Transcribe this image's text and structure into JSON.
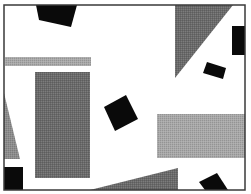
{
  "canvas": {
    "width": 251,
    "height": 194,
    "background": "#ffffff"
  },
  "colors": {
    "black": "#0a0a0a",
    "dark_gray": "#6a6a6a",
    "mid_gray": "#8c8c8c",
    "light_gray": "#a8a8a8",
    "frame": "#3a3a3a"
  },
  "frame": {
    "x": 4,
    "y": 5,
    "w": 241,
    "h": 185
  },
  "shapes": [
    {
      "name": "top-black-quad",
      "type": "polygon",
      "fill": "black",
      "points": "36,5 77,5 71,27 39,20"
    },
    {
      "name": "top-right-gray-triangle",
      "type": "polygon",
      "fill": "dark_gray",
      "points": "175,5 233,5 175,78"
    },
    {
      "name": "right-edge-black-rect",
      "type": "polygon",
      "fill": "black",
      "points": "232,26 245,26 245,55 232,55"
    },
    {
      "name": "small-black-tilted-rect",
      "type": "polygon",
      "fill": "black",
      "points": "207,62 226,68 223,79 203,73"
    },
    {
      "name": "light-gray-stripe",
      "type": "polygon",
      "fill": "light_gray",
      "points": "5,57 91,57 91,66 5,66"
    },
    {
      "name": "dark-gray-rect",
      "type": "polygon",
      "fill": "dark_gray",
      "points": "35,72 90,72 90,178 35,178"
    },
    {
      "name": "left-gray-triangle",
      "type": "polygon",
      "fill": "mid_gray",
      "points": "4,93 4,159 20,159"
    },
    {
      "name": "center-black-tilted-rect",
      "type": "polygon",
      "fill": "black",
      "points": "104,107 126,95 138,119 115,131"
    },
    {
      "name": "right-light-gray-rect",
      "type": "polygon",
      "fill": "light_gray",
      "points": "157,114 245,114 245,158 157,158"
    },
    {
      "name": "bottom-left-black-rect",
      "type": "polygon",
      "fill": "black",
      "points": "4,167 23,167 23,190 4,190"
    },
    {
      "name": "bottom-gray-wedge",
      "type": "polygon",
      "fill": "dark_gray",
      "points": "90,190 178,168 178,190"
    },
    {
      "name": "bottom-right-black-tilted-rect",
      "type": "polygon",
      "fill": "black",
      "points": "199,182 217,173 228,190 205,190"
    }
  ]
}
